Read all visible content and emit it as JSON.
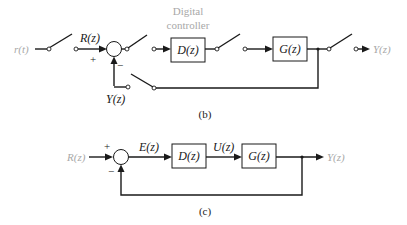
{
  "diagram_b": {
    "input_signal": "r(t)",
    "reference_label": "R(z)",
    "feedback_label": "Y(z)",
    "plus_sign": "+",
    "minus_sign": "−",
    "controller_caption_line1": "Digital",
    "controller_caption_line2": "controller",
    "controller_block": "D(z)",
    "plant_block": "G(z)",
    "output_label": "Y(z)",
    "caption": "(b)"
  },
  "diagram_c": {
    "input_label": "R(z)",
    "plus_sign": "+",
    "minus_sign": "−",
    "error_label": "E(z)",
    "controller_block": "D(z)",
    "control_label": "U(z)",
    "plant_block": "G(z)",
    "output_label": "Y(z)",
    "caption": "(c)"
  },
  "colors": {
    "line": "#1a1a1a",
    "muted_text": "#a8a8a8",
    "background": "#ffffff"
  }
}
